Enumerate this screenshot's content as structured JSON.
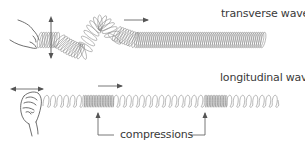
{
  "diagram": {
    "labels": {
      "transverse": "transverse wave",
      "longitudinal": "longitudinal wave",
      "compressions": "compressions"
    },
    "colors": {
      "spring": "#8a8a8a",
      "arrow": "#555555",
      "text": "#3a3a3a",
      "hand": "#4a4a4a"
    },
    "elements": [
      {
        "name": "transverse-hand",
        "desc": "hand shaking spring up and down"
      },
      {
        "name": "vertical-double-arrow",
        "desc": "up-down motion of hand"
      },
      {
        "name": "transverse-spring",
        "desc": "spring with transverse wave pulse"
      },
      {
        "name": "transverse-direction-arrow",
        "desc": "wave travels right"
      },
      {
        "name": "longitudinal-hand",
        "desc": "hand pushing spring back and forth"
      },
      {
        "name": "horizontal-double-arrow",
        "desc": "back-and-forth motion of hand"
      },
      {
        "name": "longitudinal-spring",
        "desc": "spring with compressions"
      },
      {
        "name": "longitudinal-direction-arrow",
        "desc": "wave travels right"
      },
      {
        "name": "compression-pointer-left",
        "desc": "points to first compression"
      },
      {
        "name": "compression-pointer-right",
        "desc": "points to second compression"
      }
    ]
  }
}
